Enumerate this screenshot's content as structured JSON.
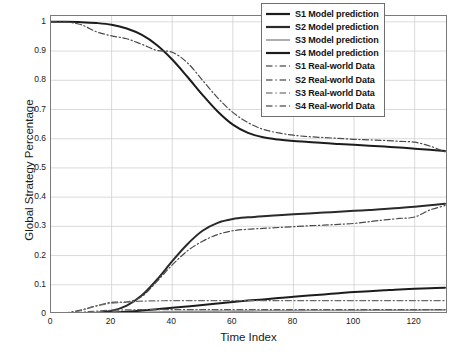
{
  "chart_data": {
    "type": "line",
    "title": "",
    "xlabel": "Time Index",
    "ylabel": "Global Strategy Percentage",
    "xlim": [
      0,
      131
    ],
    "ylim": [
      0,
      1.02
    ],
    "grid": true,
    "legend_position": "top-right",
    "xticks": [
      0,
      20,
      40,
      60,
      80,
      100,
      120
    ],
    "xticklabels": [
      "0",
      "20",
      "40",
      "60",
      "80",
      "100",
      "120"
    ],
    "yticks": [
      0,
      0.1,
      0.2,
      0.3,
      0.4,
      0.5,
      0.6,
      0.7,
      0.8,
      0.9,
      1
    ],
    "yticklabels": [
      "0",
      "0.1",
      "0.2",
      "0.3",
      "0.4",
      "0.5",
      "0.6",
      "0.7",
      "0.8",
      "0.9",
      "1"
    ],
    "series": [
      {
        "name": "S1 Model prediction",
        "style": "solid",
        "color": "#1c1c1c",
        "width": 2.0,
        "x": [
          0,
          5,
          10,
          15,
          20,
          25,
          30,
          35,
          40,
          45,
          50,
          55,
          60,
          65,
          70,
          75,
          80,
          85,
          90,
          95,
          100,
          105,
          110,
          115,
          120,
          125,
          130
        ],
        "y": [
          1.0,
          1.0,
          0.999,
          0.996,
          0.99,
          0.977,
          0.955,
          0.92,
          0.871,
          0.812,
          0.75,
          0.693,
          0.648,
          0.62,
          0.605,
          0.597,
          0.592,
          0.589,
          0.585,
          0.582,
          0.579,
          0.576,
          0.573,
          0.57,
          0.566,
          0.562,
          0.558
        ]
      },
      {
        "name": "S2 Model prediction",
        "style": "solid",
        "color": "#2a2a2a",
        "width": 2.0,
        "x": [
          0,
          5,
          10,
          15,
          20,
          25,
          30,
          35,
          40,
          45,
          50,
          55,
          60,
          65,
          70,
          75,
          80,
          85,
          90,
          95,
          100,
          105,
          110,
          115,
          120,
          125,
          130
        ],
        "y": [
          0.0,
          0.0,
          0.001,
          0.004,
          0.011,
          0.029,
          0.064,
          0.118,
          0.181,
          0.239,
          0.285,
          0.312,
          0.325,
          0.331,
          0.335,
          0.338,
          0.341,
          0.344,
          0.347,
          0.35,
          0.353,
          0.356,
          0.359,
          0.363,
          0.367,
          0.372,
          0.377
        ]
      },
      {
        "name": "S3 Model prediction",
        "style": "solid",
        "color": "#9a9a9a",
        "width": 1.6,
        "x": [
          0,
          5,
          10,
          15,
          20,
          25,
          30,
          35,
          40,
          45,
          50,
          55,
          60,
          65,
          70,
          75,
          80,
          85,
          90,
          95,
          100,
          105,
          110,
          115,
          120,
          125,
          130
        ],
        "y": [
          0.0,
          0.0,
          0.0,
          0.001,
          0.002,
          0.004,
          0.006,
          0.007,
          0.008,
          0.009,
          0.009,
          0.01,
          0.01,
          0.01,
          0.011,
          0.011,
          0.011,
          0.012,
          0.012,
          0.012,
          0.012,
          0.013,
          0.013,
          0.013,
          0.013,
          0.014,
          0.014
        ]
      },
      {
        "name": "S4 Model prediction",
        "style": "solid",
        "color": "#1c1c1c",
        "width": 2.0,
        "x": [
          0,
          5,
          10,
          15,
          20,
          25,
          30,
          35,
          40,
          45,
          50,
          55,
          60,
          65,
          70,
          75,
          80,
          85,
          90,
          95,
          100,
          105,
          110,
          115,
          120,
          125,
          130
        ],
        "y": [
          0.0,
          0.001,
          0.002,
          0.003,
          0.005,
          0.008,
          0.012,
          0.016,
          0.021,
          0.026,
          0.031,
          0.036,
          0.041,
          0.046,
          0.05,
          0.055,
          0.059,
          0.063,
          0.067,
          0.071,
          0.075,
          0.078,
          0.081,
          0.084,
          0.086,
          0.088,
          0.09
        ]
      },
      {
        "name": "S1 Real-world Data",
        "style": "dashdot",
        "color": "#4a4a4a",
        "width": 1.2,
        "x": [
          0,
          5,
          10,
          15,
          20,
          25,
          30,
          35,
          40,
          45,
          50,
          55,
          60,
          65,
          70,
          75,
          80,
          85,
          90,
          95,
          100,
          105,
          110,
          115,
          120,
          125,
          130
        ],
        "y": [
          1.0,
          0.999,
          0.99,
          0.966,
          0.952,
          0.942,
          0.923,
          0.902,
          0.896,
          0.86,
          0.8,
          0.74,
          0.69,
          0.655,
          0.632,
          0.62,
          0.612,
          0.607,
          0.604,
          0.601,
          0.598,
          0.596,
          0.594,
          0.591,
          0.588,
          0.575,
          0.555
        ]
      },
      {
        "name": "S2 Real-world Data",
        "style": "dashdot",
        "color": "#4a4a4a",
        "width": 1.2,
        "x": [
          0,
          5,
          10,
          15,
          20,
          25,
          30,
          35,
          40,
          45,
          50,
          55,
          60,
          65,
          70,
          75,
          80,
          85,
          90,
          95,
          100,
          105,
          110,
          115,
          120,
          125,
          130
        ],
        "y": [
          0.0,
          0.004,
          0.014,
          0.028,
          0.04,
          0.041,
          0.06,
          0.112,
          0.168,
          0.216,
          0.249,
          0.272,
          0.285,
          0.29,
          0.293,
          0.296,
          0.299,
          0.302,
          0.304,
          0.307,
          0.31,
          0.316,
          0.322,
          0.327,
          0.332,
          0.356,
          0.371
        ]
      },
      {
        "name": "S3 Real-world Data",
        "style": "dashdot",
        "color": "#6a6a6a",
        "width": 1.2,
        "x": [
          0,
          5,
          10,
          15,
          20,
          25,
          30,
          35,
          40,
          45,
          50,
          55,
          60,
          65,
          70,
          75,
          80,
          85,
          90,
          95,
          100,
          105,
          110,
          115,
          120,
          125,
          130
        ],
        "y": [
          0.0,
          0.003,
          0.012,
          0.028,
          0.037,
          0.041,
          0.044,
          0.045,
          0.046,
          0.046,
          0.046,
          0.046,
          0.046,
          0.046,
          0.046,
          0.046,
          0.046,
          0.046,
          0.046,
          0.046,
          0.046,
          0.046,
          0.046,
          0.046,
          0.046,
          0.046,
          0.046
        ]
      },
      {
        "name": "S4 Real-world Data",
        "style": "dashdot",
        "color": "#5a5a5a",
        "width": 1.2,
        "x": [
          0,
          5,
          10,
          15,
          20,
          25,
          30,
          35,
          40,
          45,
          50,
          55,
          60,
          65,
          70,
          75,
          80,
          85,
          90,
          95,
          100,
          105,
          110,
          115,
          120,
          125,
          130
        ],
        "y": [
          0.0,
          0.002,
          0.006,
          0.01,
          0.013,
          0.014,
          0.015,
          0.015,
          0.015,
          0.015,
          0.015,
          0.015,
          0.015,
          0.015,
          0.015,
          0.015,
          0.015,
          0.015,
          0.015,
          0.015,
          0.015,
          0.015,
          0.015,
          0.015,
          0.015,
          0.015,
          0.015
        ]
      }
    ]
  },
  "legend": {
    "entries": [
      {
        "label": "S1 Model prediction",
        "style": "solid",
        "color": "#1c1c1c",
        "width": 2.2
      },
      {
        "label": "S2 Model prediction",
        "style": "solid",
        "color": "#2a2a2a",
        "width": 2.2
      },
      {
        "label": "S3 Model prediction",
        "style": "solid",
        "color": "#9a9a9a",
        "width": 1.6
      },
      {
        "label": "S4 Model prediction",
        "style": "solid",
        "color": "#1c1c1c",
        "width": 2.2
      },
      {
        "label": "S1 Real-world Data",
        "style": "dashdot",
        "color": "#6a6a6a",
        "width": 1.3
      },
      {
        "label": "S2 Real-world Data",
        "style": "dashdot",
        "color": "#6a6a6a",
        "width": 1.3
      },
      {
        "label": "S3 Real-world Data",
        "style": "dashdot",
        "color": "#8a8a8a",
        "width": 1.3
      },
      {
        "label": "S4 Real-world Data",
        "style": "dashdot",
        "color": "#6a6a6a",
        "width": 1.3
      }
    ]
  },
  "style": {
    "grid_color": "#d0d0d0",
    "axis_color": "#7a7a7a",
    "text_color": "#1a1a1a",
    "background": "#ffffff"
  }
}
